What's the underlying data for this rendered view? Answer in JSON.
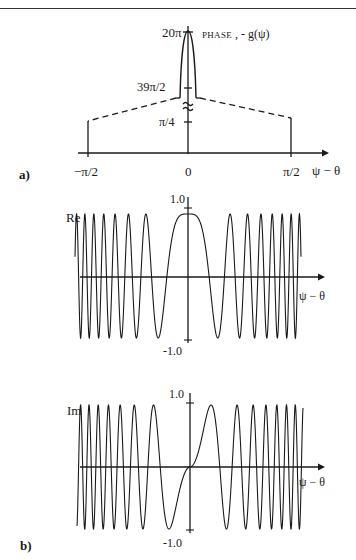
{
  "page": {
    "header_text_fragment": "ly p",
    "header_page_fragment": "(.)"
  },
  "panel_a": {
    "label": "a)",
    "ylabel_prefix": "PHASE",
    "ylabel_suffix": " ,  - g(ψ)",
    "yticks": [
      "20π",
      "39π/2",
      "π/4"
    ],
    "axis_break_symbol": "≈",
    "xticks": [
      "−π/2",
      "0",
      "π/2"
    ],
    "xlabel": "ψ − θ"
  },
  "panel_b": {
    "label": "b)",
    "re": {
      "name": "Re",
      "ytop": "1.0",
      "ybottom": "-1.0",
      "xlabel": "ψ − θ"
    },
    "im": {
      "name": "Im",
      "ytop": "1.0",
      "ybottom": "-1.0",
      "xlabel": "ψ − θ"
    }
  },
  "chart_data": [
    {
      "type": "line",
      "title": "a) PHASE, -g(ψ)",
      "xlabel": "ψ − θ",
      "ylabel": "PHASE , - g(ψ)",
      "x_ticks": [
        "−π/2",
        "0",
        "π/2"
      ],
      "y_ticks": [
        "π/4",
        "39π/2",
        "20π"
      ],
      "y_axis_break": true,
      "grid": false,
      "series": [
        {
          "name": "central peak (solid)",
          "x": [
            "-δ",
            "0",
            "δ"
          ],
          "y": [
            "39π/2",
            "20π",
            "39π/2"
          ]
        },
        {
          "name": "linear flanks (dashed)",
          "x": [
            "−π/2",
            "0",
            "π/2"
          ],
          "y": [
            "π/4",
            "39π/2 (break)",
            "π/4"
          ]
        }
      ],
      "notes": "Narrow parabolic peak rising from 39π/2 to 20π at ψ−θ = 0; dashed lines fall to π/4 at ±π/2, with vertical lines dropping to the axis."
    },
    {
      "type": "line",
      "title": "b) Re",
      "series_name": "Re",
      "xlabel": "ψ − θ",
      "ylim": [
        -1.0,
        1.0
      ],
      "y_ticks": [
        "-1.0",
        "1.0"
      ],
      "function": "cos(g(ψ))",
      "oscillations_each_side": 12,
      "value_at_zero": 1.0
    },
    {
      "type": "line",
      "title": "b) Im",
      "series_name": "Im",
      "xlabel": "ψ − θ",
      "ylim": [
        -1.0,
        1.0
      ],
      "y_ticks": [
        "-1.0",
        "1.0"
      ],
      "function": "sin(g(ψ))",
      "oscillations_each_side": 12,
      "value_at_zero": 0.0
    }
  ],
  "render": {
    "re": {
      "cx": 188,
      "cy": 276,
      "amp": 62,
      "halfwidth": 113,
      "k": 7.2,
      "phase": 0,
      "sign": 1
    },
    "im": {
      "cx": 190,
      "cy": 467,
      "amp": 62,
      "halfwidth": 113,
      "k": 7.2,
      "phase": 0,
      "sign": 1
    }
  }
}
